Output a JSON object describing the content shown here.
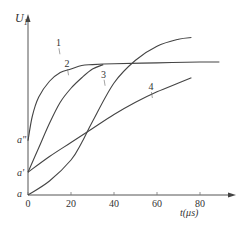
{
  "chart_data": {
    "type": "line",
    "title": "",
    "xlabel": "t(μs)",
    "ylabel": "U_1",
    "xlim": [
      0,
      90
    ],
    "x_ticks": [
      0,
      20,
      40,
      60,
      80
    ],
    "x_tick_labels": [
      "0",
      "20",
      "40",
      "60",
      "80"
    ],
    "y_tick_labels": [
      "a",
      "a'",
      "a\""
    ],
    "y_levels_note": "y values in relative units above axis; a=0.0, a'=0.13, a''=0.31, top of axis=1.0",
    "y_levels": {
      "a": 0.0,
      "a'": 0.13,
      "a\"": 0.31
    },
    "grid": false,
    "legend": "inline numeric labels 1–4",
    "series": [
      {
        "name": "1",
        "x": [
          0,
          2,
          5,
          10,
          15,
          20,
          25,
          30,
          40,
          60,
          80,
          89
        ],
        "y": [
          0.31,
          0.45,
          0.56,
          0.65,
          0.7,
          0.72,
          0.74,
          0.745,
          0.75,
          0.755,
          0.76,
          0.76
        ]
      },
      {
        "name": "2",
        "x": [
          0,
          5,
          10,
          15,
          20,
          25,
          30,
          35
        ],
        "y": [
          0.13,
          0.27,
          0.41,
          0.53,
          0.61,
          0.67,
          0.72,
          0.745
        ]
      },
      {
        "name": "3",
        "x": [
          0,
          10,
          20,
          25,
          30,
          40,
          50,
          60,
          70,
          76
        ],
        "y": [
          0.0,
          0.08,
          0.2,
          0.3,
          0.42,
          0.64,
          0.77,
          0.85,
          0.89,
          0.9
        ]
      },
      {
        "name": "4",
        "x": [
          0,
          10,
          20,
          30,
          40,
          50,
          60,
          70,
          76
        ],
        "y": [
          0.13,
          0.22,
          0.3,
          0.38,
          0.46,
          0.53,
          0.59,
          0.64,
          0.67
        ]
      }
    ],
    "curve_labels": [
      {
        "text": "1",
        "x": 13,
        "y": 0.85
      },
      {
        "text": "2",
        "x": 17,
        "y": 0.73
      },
      {
        "text": "3",
        "x": 34,
        "y": 0.67
      },
      {
        "text": "4",
        "x": 56,
        "y": 0.6
      }
    ]
  },
  "axis": {
    "y_label_main": "U",
    "y_label_sub": "1",
    "x_label": "t(μs)",
    "y_ticks": [
      "a\"",
      "a'",
      "a"
    ]
  }
}
